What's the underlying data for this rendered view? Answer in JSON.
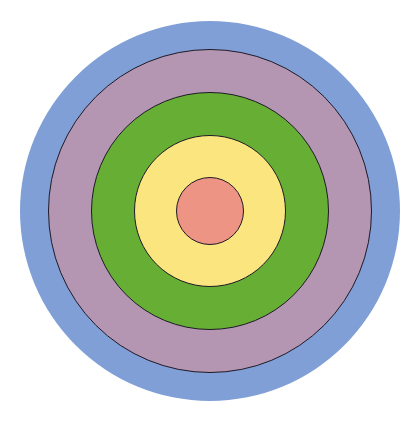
{
  "diagram": {
    "type": "concentric-circles",
    "center": {
      "x": 210,
      "y": 211
    },
    "glow": {
      "color": "#7f9fd6",
      "radius": 190
    },
    "rings": [
      {
        "name": "outer",
        "color": "#b495b2",
        "radius": 162
      },
      {
        "name": "second",
        "color": "#67ae35",
        "radius": 119
      },
      {
        "name": "third",
        "color": "#fbe57e",
        "radius": 76
      },
      {
        "name": "center",
        "color": "#ee9485",
        "radius": 34
      }
    ]
  }
}
